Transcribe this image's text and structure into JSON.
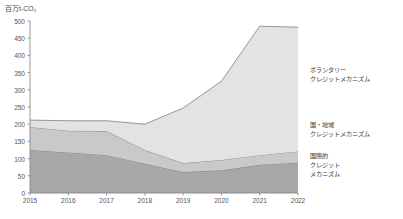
{
  "chart_data": {
    "type": "area",
    "title": "",
    "subtitle": "",
    "ylabel": "百万t-CO₂",
    "xlabel": "",
    "ylim": [
      0,
      500
    ],
    "ytick_step": 50,
    "grid": false,
    "legend_position": "right-inline",
    "stacked": true,
    "categories": [
      "2015",
      "2016",
      "2017",
      "2018",
      "2019",
      "2020",
      "2021",
      "2022"
    ],
    "x": [
      2015,
      2016,
      2017,
      2018,
      2019,
      2020,
      2021,
      2022
    ],
    "yticks": [
      "0",
      "50",
      "100",
      "150",
      "200",
      "250",
      "300",
      "350",
      "400",
      "450",
      "500"
    ],
    "series": [
      {
        "name": "国際的クレジットメカニズム",
        "label_lines": [
          "国際的",
          "クレジット",
          "メカニズム"
        ],
        "color": "#a8a8a8",
        "values": [
          125,
          118,
          110,
          85,
          61,
          66,
          82,
          88
        ]
      },
      {
        "name": "国・地域クレジットメカニズム",
        "label_lines": [
          "国・地域",
          "クレジットメカニズム"
        ],
        "color": "#c9c9c9",
        "values": [
          67,
          63,
          70,
          40,
          26,
          30,
          28,
          33
        ]
      },
      {
        "name": "ボランタリークレジットメカニズム",
        "label_lines": [
          "ボランタリー",
          "クレジットメカニズム"
        ],
        "color": "#e3e3e3",
        "values": [
          20,
          29,
          30,
          75,
          160,
          229,
          375,
          361
        ]
      }
    ],
    "totals": [
      212,
      210,
      210,
      200,
      247,
      325,
      485,
      482
    ]
  },
  "axis": {
    "line_color": "#7d7d7d",
    "tick_color": "#7d7d7d"
  }
}
